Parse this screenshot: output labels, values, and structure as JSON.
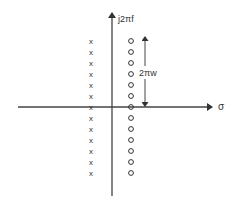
{
  "diagram": {
    "type": "pole-zero-plot",
    "axes": {
      "vertical_label": "j2πf",
      "horizontal_label": "σ"
    },
    "spacing_annotation": {
      "label": "2πw"
    },
    "poles": {
      "marker": "x",
      "count": 13,
      "column": "left"
    },
    "zeros": {
      "marker": "o",
      "count": 13,
      "column": "right"
    },
    "colors": {
      "ink": "#333333",
      "background": "#ffffff"
    }
  }
}
